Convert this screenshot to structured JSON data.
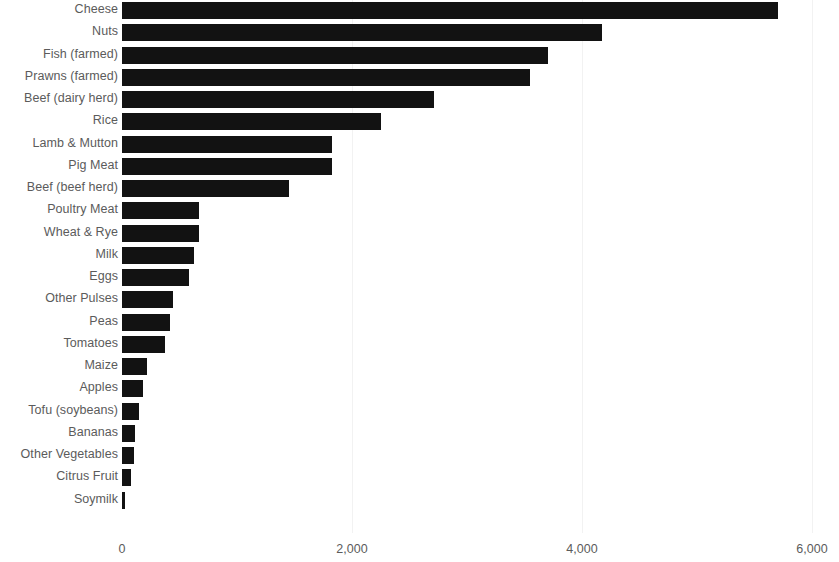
{
  "chart_data": {
    "type": "bar",
    "orientation": "horizontal",
    "title": "",
    "subtitle": "",
    "xlabel": "",
    "ylabel": "",
    "xlim": [
      0,
      6000
    ],
    "ylim": null,
    "grid": true,
    "gridlines_x": [
      2000,
      4000,
      6000
    ],
    "legend": null,
    "legend_position": "none",
    "xticks": [
      0,
      2000,
      4000,
      6000
    ],
    "xtick_labels": [
      "0",
      "2,000",
      "4,000",
      "6,000"
    ],
    "categories": [
      "Cheese",
      "Nuts",
      "Fish (farmed)",
      "Prawns (farmed)",
      "Beef (dairy herd)",
      "Rice",
      "Lamb & Mutton",
      "Pig Meat",
      "Beef (beef herd)",
      "Poultry Meat",
      "Wheat & Rye",
      "Milk",
      "Eggs",
      "Other Pulses",
      "Peas",
      "Tomatoes",
      "Maize",
      "Apples",
      "Tofu (soybeans)",
      "Bananas",
      "Other Vegetables",
      "Citrus Fruit",
      "Soymilk"
    ],
    "values": [
      5700,
      4170,
      3700,
      3550,
      2710,
      2250,
      1830,
      1830,
      1450,
      670,
      670,
      630,
      580,
      440,
      420,
      370,
      220,
      180,
      150,
      115,
      100,
      80,
      28
    ],
    "bar_color": "#121212",
    "grid_color": "#f2f2f2",
    "tick_label_color": "#5b5b5b",
    "background_color": "#ffffff"
  }
}
